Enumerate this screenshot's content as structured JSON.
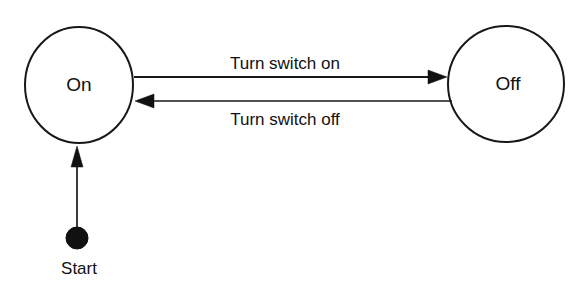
{
  "diagram": {
    "type": "state-machine",
    "title": "",
    "background_color": "#ffffff",
    "stroke_color": "#181818",
    "text_color": "#111111",
    "states": [
      {
        "id": "on",
        "label": "On",
        "shape": "ellipse",
        "cx": 79,
        "cy": 85,
        "rx": 54,
        "ry": 58
      },
      {
        "id": "off",
        "label": "Off",
        "shape": "ellipse",
        "cx": 506,
        "cy": 84,
        "rx": 58,
        "ry": 58
      }
    ],
    "start_node": {
      "label": "Start",
      "shape": "filled-circle",
      "cx": 77,
      "cy": 238,
      "r": 11,
      "color": "#111111"
    },
    "transitions": [
      {
        "id": "on-to-off",
        "from": "on",
        "to": "off",
        "label": "Turn switch on",
        "label_position": "above",
        "direction": "right"
      },
      {
        "id": "off-to-on",
        "from": "off",
        "to": "on",
        "label": "Turn switch off",
        "label_position": "below",
        "direction": "left"
      },
      {
        "id": "start-to-on",
        "from": "start",
        "to": "on",
        "label": "",
        "label_position": "none",
        "direction": "up"
      }
    ]
  }
}
